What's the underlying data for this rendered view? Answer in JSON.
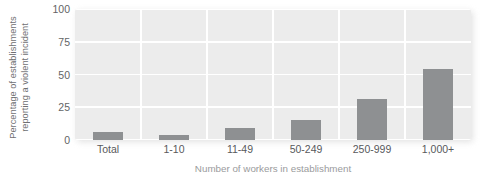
{
  "chart_data": {
    "type": "bar",
    "title": "",
    "subtitle": "",
    "xlabel": "Number of workers in establishment",
    "ylabel_lines": [
      "Percentage of establishments",
      "reporting a violent incident"
    ],
    "ylabel": "Percentage of establishments reporting a violent incident",
    "categories": [
      "Total",
      "1-10",
      "11-49",
      "50-249",
      "250-999",
      "1,000+"
    ],
    "values": [
      6,
      4,
      9,
      15,
      31,
      54
    ],
    "ylim": [
      0,
      100
    ],
    "yticks": [
      0,
      25,
      50,
      75,
      100
    ],
    "ytick_labels": [
      "0",
      "25",
      "50",
      "75",
      "100"
    ],
    "grid": "horizontal-and-vertical",
    "legend": "none",
    "series": [
      {
        "name": "Percentage of establishments reporting a violent incident",
        "values": [
          6,
          4,
          9,
          15,
          31,
          54
        ]
      }
    ],
    "colors": {
      "bar_fill": "#8e9092",
      "plot_background": "#ececec",
      "gridline": "#ffffff",
      "tick_label": "#58595b",
      "axis_title": "#9a9b9d",
      "y_axis_title": "#6f7072",
      "page_background": "#ffffff"
    }
  }
}
